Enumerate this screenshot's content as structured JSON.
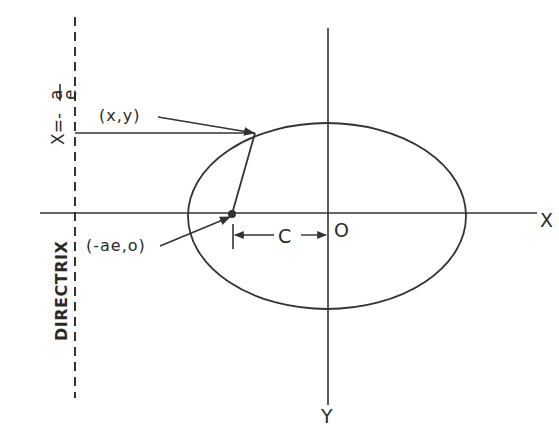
{
  "diagram": {
    "labels": {
      "x_axis": "X",
      "y_axis": "Y",
      "origin": "O",
      "point": "(x,y)",
      "focus": "(-ae,o)",
      "distance_c": "C",
      "directrix": "DIRECTRIX",
      "directrix_eq_prefix": "X=-",
      "directrix_eq_num": "a",
      "directrix_eq_den": "e"
    },
    "colors": {
      "stroke": "#333333",
      "background": "#ffffff"
    },
    "geometry": {
      "ellipse": {
        "cx": 327,
        "cy": 216,
        "rx": 139,
        "ry": 93
      },
      "x_axis": {
        "x1": 40,
        "x2": 537,
        "y": 213
      },
      "y_axis": {
        "x": 328,
        "y1": 28,
        "y2": 405
      },
      "directrix_x": 75,
      "focus": {
        "x": 232,
        "y": 214
      },
      "point": {
        "x": 255,
        "y": 133
      }
    }
  }
}
